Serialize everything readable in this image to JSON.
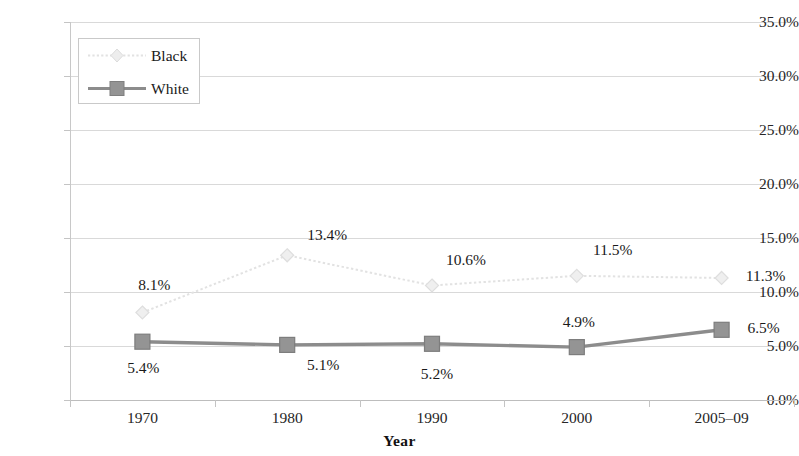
{
  "chart_data": {
    "type": "line",
    "title": "",
    "subtitle": "",
    "xlabel": "Year",
    "ylabel": "",
    "categories": [
      "1970",
      "1980",
      "1990",
      "2000",
      "2005–09"
    ],
    "series": [
      {
        "name": "Black",
        "color": "#e2e2e2",
        "marker": "diamond",
        "line_style": "dotted",
        "values": [
          8.1,
          13.4,
          10.6,
          11.5,
          11.3
        ],
        "labels": [
          "8.1%",
          "13.4%",
          "10.6%",
          "11.5%",
          "11.3%"
        ]
      },
      {
        "name": "White",
        "color": "#8c8c8c",
        "marker": "square",
        "line_style": "solid",
        "values": [
          5.4,
          5.1,
          5.2,
          4.9,
          6.5
        ],
        "labels": [
          "5.4%",
          "5.1%",
          "5.2%",
          "4.9%",
          "6.5%"
        ]
      }
    ],
    "ylim": [
      0,
      35
    ],
    "ytick_values": [
      0,
      5,
      10,
      15,
      20,
      25,
      30,
      35
    ],
    "ytick_labels": [
      "0.0%",
      "5.0%",
      "10.0%",
      "15.0%",
      "20.0%",
      "25.0%",
      "30.0%",
      "35.0%"
    ],
    "grid": true,
    "gridline_color": "#d9d9d9",
    "legend_position": "upper-left",
    "legend_entries": [
      "Black",
      "White"
    ],
    "background_color": "#ffffff",
    "axis_color": "#c4c4c4"
  }
}
